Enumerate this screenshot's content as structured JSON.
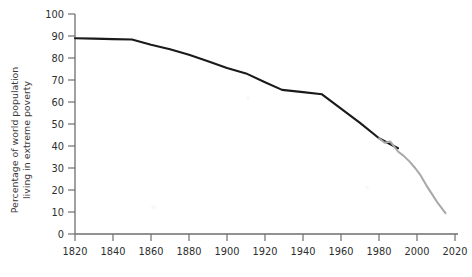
{
  "chart_data": {
    "type": "line",
    "title": "",
    "subtitle": "",
    "xlabel": "",
    "ylabel": "Percentage of world population living in extreme poverty",
    "ylabel_line1": "Percentage of world population",
    "ylabel_line2": "living in extreme poverty",
    "xlim": [
      1820,
      2020
    ],
    "ylim": [
      0,
      100
    ],
    "grid": false,
    "legend": "none",
    "x_ticks": [
      1820,
      1840,
      1860,
      1880,
      1900,
      1920,
      1940,
      1960,
      1980,
      2000,
      2020
    ],
    "x_tick_labels": [
      "1820",
      "1840",
      "1860",
      "1880",
      "1900",
      "1920",
      "1940",
      "1960",
      "1980",
      "2000",
      "2020"
    ],
    "y_ticks": [
      0,
      10,
      20,
      30,
      40,
      50,
      60,
      70,
      80,
      90,
      100
    ],
    "y_tick_labels": [
      "0",
      "10",
      "20",
      "30",
      "40",
      "50",
      "60",
      "70",
      "80",
      "90",
      "100"
    ],
    "series": [
      {
        "name": "historical-estimate",
        "color": "#1a1a1a",
        "x": [
          1820,
          1830,
          1840,
          1850,
          1860,
          1870,
          1880,
          1890,
          1900,
          1910,
          1920,
          1929,
          1940,
          1950,
          1960,
          1970,
          1980,
          1990
        ],
        "values": [
          89.0,
          88.8,
          88.6,
          88.4,
          86.0,
          84.0,
          81.5,
          78.5,
          75.5,
          73.0,
          69.0,
          65.5,
          64.5,
          63.5,
          57.0,
          50.5,
          43.5,
          39.0
        ]
      },
      {
        "name": "recent-estimate",
        "color": "#a8a8a8",
        "x": [
          1980,
          1983,
          1986,
          1990,
          1993,
          1996,
          1999,
          2002,
          2005,
          2008,
          2011,
          2015
        ],
        "values": [
          43.5,
          41.5,
          42.0,
          37.5,
          35.5,
          33.0,
          30.0,
          26.5,
          22.0,
          18.0,
          14.0,
          9.5
        ]
      }
    ]
  },
  "axes": {
    "y_axis_name": "y-axis",
    "x_axis_name": "x-axis"
  }
}
